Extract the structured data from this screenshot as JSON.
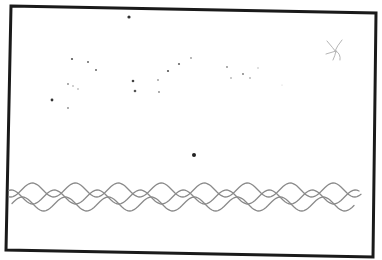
{
  "drawing": {
    "subject": "hand-drawn night sky with stars above ocean waves",
    "background": "#ffffff",
    "frame": {
      "color": "#1a1a1a",
      "corners": [
        [
          11,
          6
        ],
        [
          376,
          13
        ],
        [
          373,
          257
        ],
        [
          6,
          250
        ]
      ]
    },
    "stars": [
      {
        "x": 129,
        "y": 17,
        "r": 1.6,
        "color": "#333333"
      },
      {
        "x": 72,
        "y": 59,
        "r": 1.1,
        "color": "#555555"
      },
      {
        "x": 88,
        "y": 62,
        "r": 1.0,
        "color": "#666666"
      },
      {
        "x": 96,
        "y": 70,
        "r": 1.0,
        "color": "#666666"
      },
      {
        "x": 68,
        "y": 84,
        "r": 0.9,
        "color": "#888888"
      },
      {
        "x": 73,
        "y": 86,
        "r": 0.8,
        "color": "#999999"
      },
      {
        "x": 78,
        "y": 89,
        "r": 0.8,
        "color": "#999999"
      },
      {
        "x": 52,
        "y": 100,
        "r": 1.4,
        "color": "#333333"
      },
      {
        "x": 68,
        "y": 108,
        "r": 0.9,
        "color": "#888888"
      },
      {
        "x": 133,
        "y": 81,
        "r": 1.3,
        "color": "#444444"
      },
      {
        "x": 135,
        "y": 91,
        "r": 1.3,
        "color": "#555555"
      },
      {
        "x": 158,
        "y": 80,
        "r": 0.9,
        "color": "#999999"
      },
      {
        "x": 159,
        "y": 92,
        "r": 0.9,
        "color": "#888888"
      },
      {
        "x": 168,
        "y": 71,
        "r": 1.1,
        "color": "#555555"
      },
      {
        "x": 179,
        "y": 64,
        "r": 1.1,
        "color": "#666666"
      },
      {
        "x": 191,
        "y": 58,
        "r": 0.9,
        "color": "#999999"
      },
      {
        "x": 227,
        "y": 67,
        "r": 0.9,
        "color": "#888888"
      },
      {
        "x": 231,
        "y": 78,
        "r": 0.8,
        "color": "#888888"
      },
      {
        "x": 243,
        "y": 74,
        "r": 0.9,
        "color": "#777777"
      },
      {
        "x": 250,
        "y": 78,
        "r": 0.8,
        "color": "#888888"
      },
      {
        "x": 258,
        "y": 68,
        "r": 0.7,
        "color": "#aaaaaa"
      },
      {
        "x": 282,
        "y": 85,
        "r": 0.6,
        "color": "#cccccc"
      },
      {
        "x": 194,
        "y": 155,
        "r": 2.0,
        "color": "#222222"
      }
    ],
    "sun_glyph": {
      "x": 335,
      "y": 50,
      "color": "#b5b5b5"
    },
    "waves": {
      "color": "#8a8a8a",
      "lines": [
        {
          "start_x": 9,
          "end_x": 362,
          "baseline_y": 190,
          "amplitude": 7,
          "wavelength": 43,
          "phase": 0
        },
        {
          "start_x": 9,
          "end_x": 360,
          "baseline_y": 197,
          "amplitude": 7,
          "wavelength": 43,
          "phase": 21
        },
        {
          "start_x": 12,
          "end_x": 355,
          "baseline_y": 204,
          "amplitude": 7,
          "wavelength": 43,
          "phase": 10
        }
      ]
    }
  }
}
